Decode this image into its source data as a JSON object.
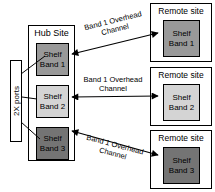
{
  "diagram": {
    "ports_box": {
      "label": "2X ports"
    },
    "hub": {
      "title": "Hub Site",
      "shelves": [
        {
          "label": "Shelf\nBand 1",
          "color": "#999999"
        },
        {
          "label": "Shelf\nBand 2",
          "color": "#d4d4d4"
        },
        {
          "label": "Shelf\nBand 3",
          "color": "#747474"
        }
      ]
    },
    "remote_sites": [
      {
        "title": "Remote site",
        "shelf": {
          "label": "Shelf\nBand 1",
          "color": "#999999"
        }
      },
      {
        "title": "Remote site",
        "shelf": {
          "label": "Shelf\nBand 2",
          "color": "#d4d4d4"
        }
      },
      {
        "title": "Remote site",
        "shelf": {
          "label": "Shelf\nBand 3",
          "color": "#747474"
        }
      }
    ],
    "links": [
      {
        "label": "Band 1 Overhead\nChannel"
      },
      {
        "label": "Band 1 Overhead\nChannel"
      },
      {
        "label": "Band 1 Overhead\nChannel"
      }
    ],
    "line_color": "#000000"
  }
}
